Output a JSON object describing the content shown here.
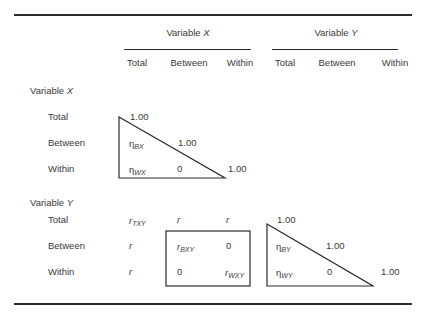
{
  "table": {
    "group_headers": [
      {
        "label": "Variable ",
        "var": "X"
      },
      {
        "label": "Variable ",
        "var": "Y"
      }
    ],
    "column_headers": [
      "Total",
      "Between",
      "Within",
      "Total",
      "Between",
      "Within"
    ],
    "sections": [
      {
        "label": "Variable ",
        "var": "X",
        "rows": [
          {
            "label": "Total",
            "cells": [
              "1.00",
              "",
              "",
              "",
              "",
              ""
            ]
          },
          {
            "label": "Between",
            "cells": [
              {
                "sym": "η",
                "sub": "BX"
              },
              "1.00",
              "",
              "",
              "",
              ""
            ]
          },
          {
            "label": "Within",
            "cells": [
              {
                "sym": "η",
                "sub": "WX"
              },
              "0",
              "1.00",
              "",
              "",
              ""
            ]
          }
        ]
      },
      {
        "label": "Variable ",
        "var": "Y",
        "rows": [
          {
            "label": "Total",
            "cells": [
              {
                "sym": "r",
                "sub": "TXY"
              },
              "r",
              "r",
              "1.00",
              "",
              ""
            ]
          },
          {
            "label": "Between",
            "cells": [
              "r",
              {
                "sym": "r",
                "sub": "BXY"
              },
              "0",
              {
                "sym": "η",
                "sub": "BY"
              },
              "1.00",
              ""
            ]
          },
          {
            "label": "Within",
            "cells": [
              "r",
              "0",
              {
                "sym": "r",
                "sub": "WXY"
              },
              {
                "sym": "η",
                "sub": "WY"
              },
              "0",
              "1.00"
            ]
          }
        ]
      }
    ]
  }
}
